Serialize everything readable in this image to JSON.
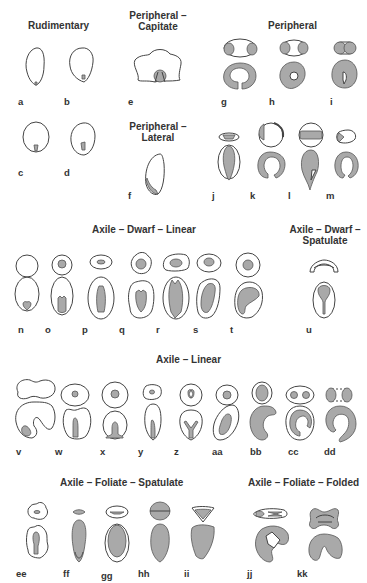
{
  "figure": {
    "fill_color": "#a9a9a9",
    "stroke_color": "#444444",
    "text_color": "#333333",
    "groups": [
      {
        "id": "rudimentary",
        "title": "Rudimentary",
        "items": [
          "a",
          "b",
          "c",
          "d"
        ]
      },
      {
        "id": "peripheral-capitate",
        "title": "Peripheral –\nCapitate",
        "items": [
          "e"
        ]
      },
      {
        "id": "peripheral",
        "title": "Peripheral",
        "items": [
          "g",
          "h",
          "i",
          "j",
          "k",
          "l",
          "m"
        ]
      },
      {
        "id": "peripheral-lateral",
        "title": "Peripheral –\nLateral",
        "items": [
          "f"
        ]
      },
      {
        "id": "axile-dwarf-linear",
        "title": "Axile – Dwarf – Linear",
        "items": [
          "n",
          "o",
          "p",
          "q",
          "r",
          "s",
          "t"
        ]
      },
      {
        "id": "axile-dwarf-spatulate",
        "title": "Axile – Dwarf –\nSpatulate",
        "items": [
          "u"
        ]
      },
      {
        "id": "axile-linear",
        "title": "Axile – Linear",
        "items": [
          "v",
          "w",
          "x",
          "y",
          "z",
          "aa",
          "bb",
          "cc",
          "dd"
        ]
      },
      {
        "id": "axile-foliate-spatulate",
        "title": "Axile – Foliate – Spatulate",
        "items": [
          "ee",
          "ff",
          "gg",
          "hh",
          "ii"
        ]
      },
      {
        "id": "axile-foliate-folded",
        "title": "Axile – Foliate – Folded",
        "items": [
          "jj",
          "kk"
        ]
      }
    ],
    "titles": {
      "rudimentary": "Rudimentary",
      "peripheral_capitate_1": "Peripheral –",
      "peripheral_capitate_2": "Capitate",
      "peripheral": "Peripheral",
      "peripheral_lateral_1": "Peripheral –",
      "peripheral_lateral_2": "Lateral",
      "axile_dwarf_linear": "Axile – Dwarf – Linear",
      "axile_dwarf_spatulate_1": "Axile – Dwarf –",
      "axile_dwarf_spatulate_2": "Spatulate",
      "axile_linear": "Axile – Linear",
      "axile_foliate_spatulate": "Axile – Foliate – Spatulate",
      "axile_foliate_folded": "Axile – Foliate – Folded"
    },
    "labels": {
      "a": "a",
      "b": "b",
      "c": "c",
      "d": "d",
      "e": "e",
      "f": "f",
      "g": "g",
      "h": "h",
      "i": "i",
      "j": "j",
      "k": "k",
      "l": "l",
      "m": "m",
      "n": "n",
      "o": "o",
      "p": "p",
      "q": "q",
      "r": "r",
      "s": "s",
      "t": "t",
      "u": "u",
      "v": "v",
      "w": "w",
      "x": "x",
      "y": "y",
      "z": "z",
      "aa": "aa",
      "bb": "bb",
      "cc": "cc",
      "dd": "dd",
      "ee": "ee",
      "ff": "ff",
      "gg": "gg",
      "hh": "hh",
      "ii": "ii",
      "jj": "jj",
      "kk": "kk"
    }
  }
}
